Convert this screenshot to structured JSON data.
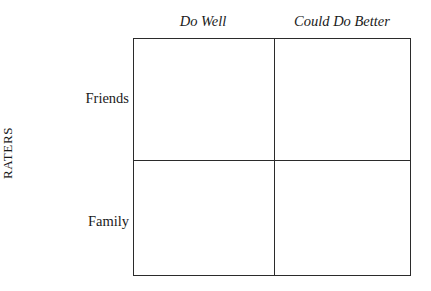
{
  "figure": {
    "type": "2x2-matrix",
    "axis_label_vertical": "RATERS",
    "column_headers": [
      "Do Well",
      "Could Do Better"
    ],
    "row_labels": [
      "Friends",
      "Family"
    ],
    "cells": [
      {
        "row": "Friends",
        "column": "Do Well",
        "content": ""
      },
      {
        "row": "Friends",
        "column": "Could Do Better",
        "content": ""
      },
      {
        "row": "Family",
        "column": "Do Well",
        "content": ""
      },
      {
        "row": "Family",
        "column": "Could Do Better",
        "content": ""
      }
    ],
    "colors": {
      "background": "#ffffff",
      "line": "#2b2b2b",
      "text": "#1a1a1a"
    }
  }
}
